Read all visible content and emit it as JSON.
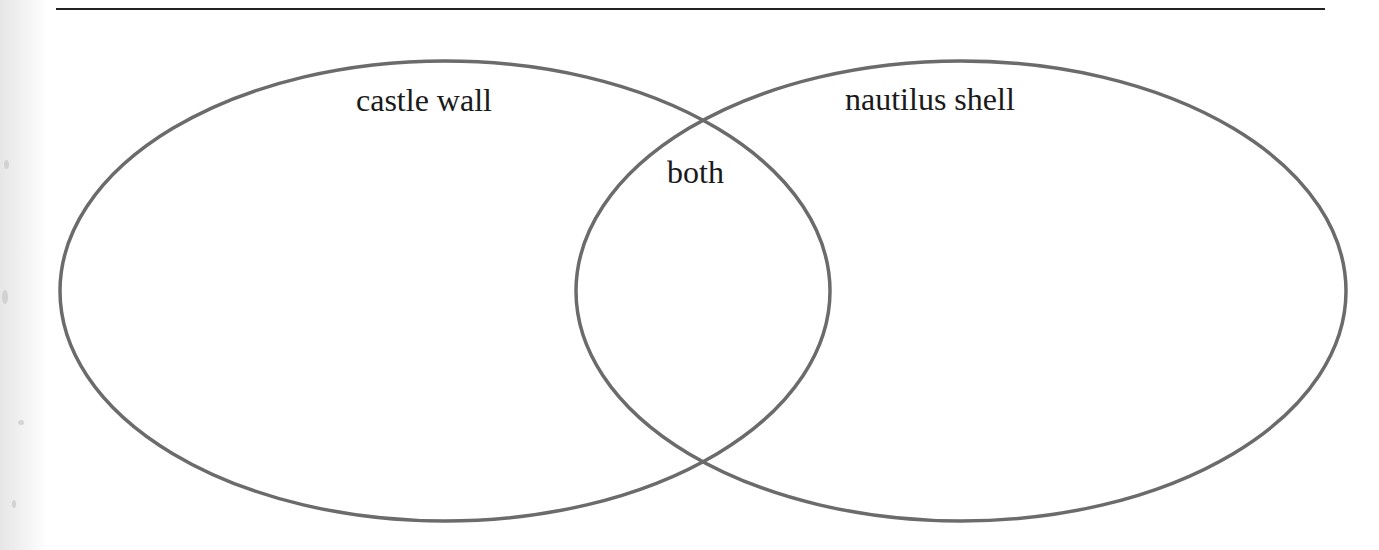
{
  "diagram": {
    "type": "venn",
    "top_rule": {
      "x1": 56,
      "x2": 1325,
      "y": 9,
      "color": "#222222"
    },
    "stroke_color": "#6b6b6b",
    "sets": [
      {
        "label": "castle wall",
        "cx": 445,
        "cy": 291,
        "rx": 385,
        "ry": 230,
        "label_x": 356,
        "label_y": 84
      },
      {
        "label": "nautilus shell",
        "cx": 961,
        "cy": 291,
        "rx": 385,
        "ry": 230,
        "label_x": 845,
        "label_y": 83
      }
    ],
    "intersection": {
      "label": "both",
      "label_x": 667,
      "label_y": 156
    }
  }
}
